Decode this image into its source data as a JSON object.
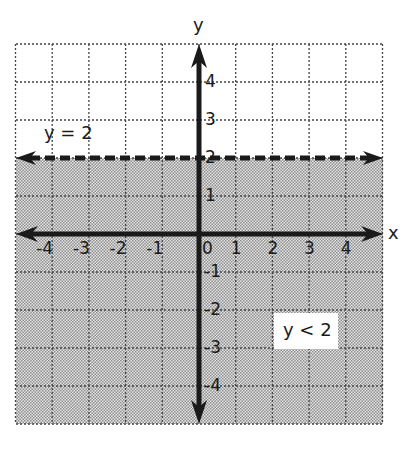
{
  "chart_data": {
    "type": "inequality-graph",
    "title": "",
    "xlabel": "x",
    "ylabel": "y",
    "xlim": [
      -5,
      5
    ],
    "ylim": [
      -5,
      5
    ],
    "grid": true,
    "grid_style": "dotted",
    "x_ticks": [
      "-4",
      "-3",
      "-2",
      "-1",
      "0",
      "1",
      "2",
      "3",
      "4"
    ],
    "y_ticks": [
      "4",
      "3",
      "2",
      "1",
      "-1",
      "-2",
      "-3",
      "-4"
    ],
    "boundary": {
      "equation": "y = 2",
      "value": 2,
      "style": "dashed",
      "label": "y = 2"
    },
    "inequality": {
      "expression": "y < 2",
      "label": "y < 2",
      "shaded_region": "below",
      "shading": "halftone gray"
    }
  },
  "labels": {
    "x_axis": "x",
    "y_axis": "y",
    "origin": "0",
    "boundary_label": "y = 2",
    "region_label": "y < 2"
  },
  "colors": {
    "axis": "#1a1a1a",
    "grid": "#444444",
    "shade_light": "#e8e8e8",
    "shade_dark": "#8a8a8a",
    "background": "#ffffff"
  }
}
